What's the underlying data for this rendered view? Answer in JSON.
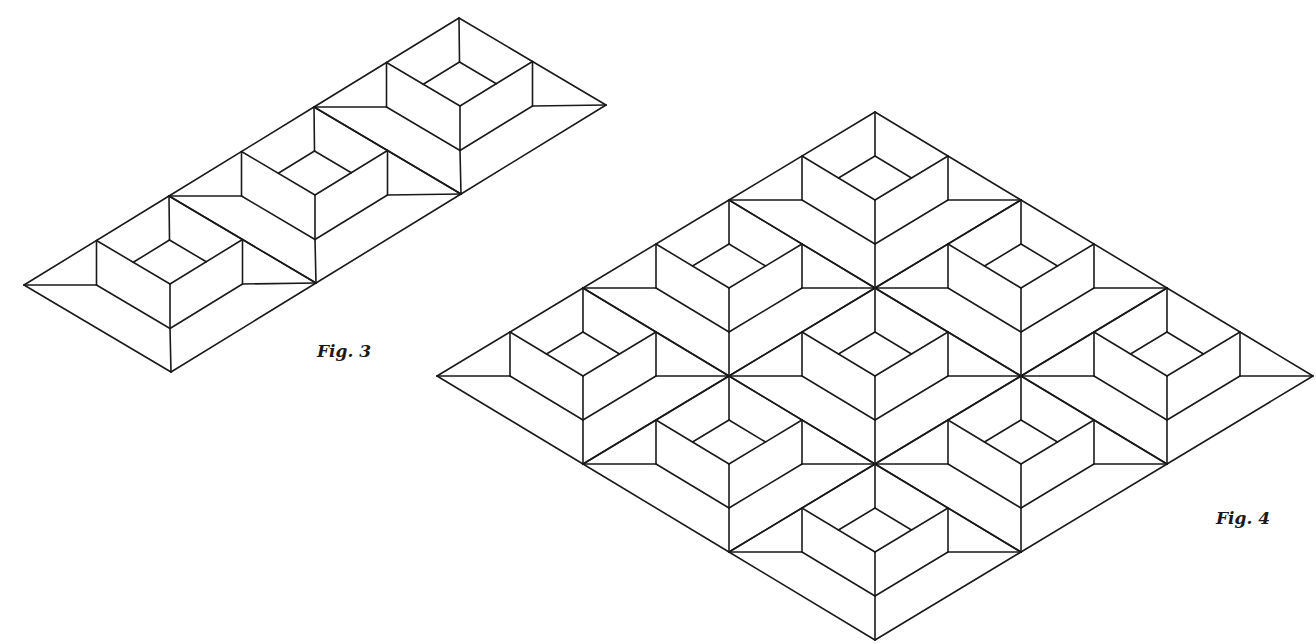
{
  "figures": [
    {
      "id": "fig3",
      "label": "Fig. 3",
      "description": "Isometric strip of three recessed square boxes in rhombic cells",
      "origin": [
        24,
        285
      ],
      "vec_a": [
        145,
        -89
      ],
      "vec_b": [
        147,
        87
      ],
      "cells_a": 3,
      "cells_b": 1
    },
    {
      "id": "fig4",
      "label": "Fig. 4",
      "description": "Isometric 3x3 lattice of recessed square boxes in rhombic cells",
      "origin": [
        437,
        376
      ],
      "vec_a": [
        146,
        -88
      ],
      "vec_b": [
        146,
        88
      ],
      "cells_a": 3,
      "cells_b": 3
    }
  ],
  "style": {
    "stroke": "#1a1a1a",
    "stroke_width": 1.6,
    "background": "#ffffff"
  }
}
